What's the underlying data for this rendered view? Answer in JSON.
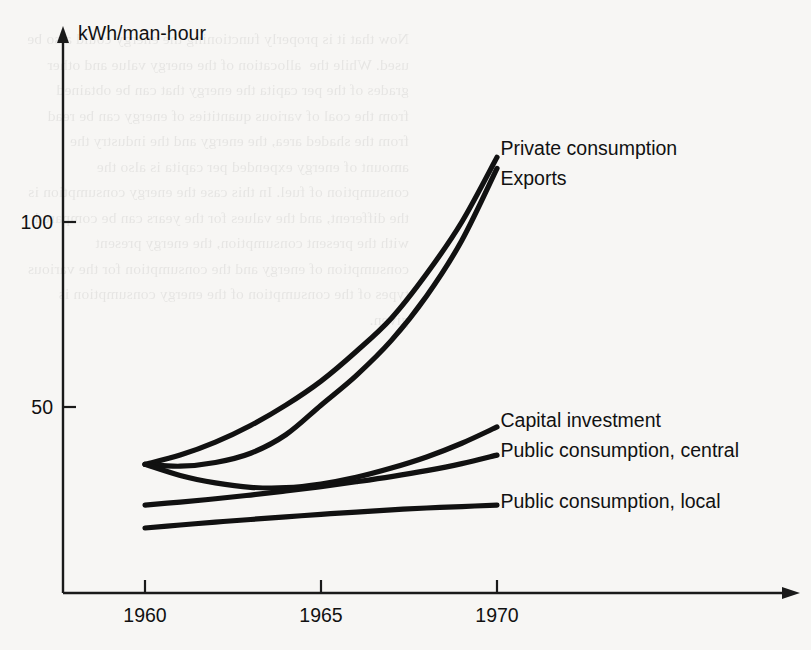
{
  "page": {
    "background_color": "#f7f6f4",
    "ink_color": "#111111",
    "bleed_text": "Now that it is properly functioning the energy could also be used. While the  allocation of the energy value and other grades of the per capita the energy that can be obtained from the coal of various quantities of energy can be read from the shaded area, the energy and the industry the amount of energy expended per capita is also the consumption of fuel. In this case the energy consumption is the different, and the values for the years can be compared with the present consumption, the energy present consumption of energy and the consumption for the various types of the consumption of the energy consumption is given."
  },
  "chart_data": {
    "type": "line",
    "title": "",
    "subtitle": "",
    "xlabel": "",
    "ylabel": "kWh/man-hour",
    "xlim": [
      1959.0,
      1971.5
    ],
    "ylim": [
      0,
      130
    ],
    "grid": false,
    "legend_position": "right-inline-labels",
    "x_ticks": [
      1960,
      1965,
      1970
    ],
    "x_tick_labels": [
      "1960",
      "1965",
      "1970"
    ],
    "y_ticks": [
      50,
      100
    ],
    "y_tick_labels": [
      "50",
      "100"
    ],
    "x": [
      1960,
      1961,
      1962,
      1963,
      1964,
      1965,
      1966,
      1967,
      1968,
      1969,
      1970
    ],
    "series": [
      {
        "name": "Private consumption",
        "label": "Private consumption",
        "values": [
          34.5,
          37.0,
          40.5,
          45.0,
          50.5,
          57.0,
          65.0,
          74.0,
          86.0,
          100.0,
          117.5
        ],
        "label_x": 1970.1,
        "label_y": 120.0
      },
      {
        "name": "Exports",
        "label": "Exports",
        "values": [
          34.5,
          34.0,
          35.0,
          37.5,
          42.5,
          50.5,
          58.5,
          68.0,
          80.0,
          95.0,
          114.5
        ],
        "label_x": 1970.1,
        "label_y": 112.0
      },
      {
        "name": "Capital investment",
        "label": "Capital investment",
        "values": [
          34.5,
          31.5,
          29.5,
          28.3,
          28.2,
          29.2,
          31.0,
          33.5,
          36.5,
          40.2,
          44.6
        ],
        "label_x": 1970.1,
        "label_y": 46.5
      },
      {
        "name": "Public consumption, central",
        "label": "Public consumption, central",
        "values": [
          23.5,
          24.3,
          25.2,
          26.2,
          27.3,
          28.5,
          29.8,
          31.2,
          32.8,
          34.7,
          37.0
        ],
        "label_x": 1970.1,
        "label_y": 38.5
      },
      {
        "name": "Public consumption, local",
        "label": "Public consumption, local",
        "values": [
          17.3,
          18.1,
          18.9,
          19.6,
          20.3,
          21.0,
          21.6,
          22.2,
          22.7,
          23.1,
          23.5
        ],
        "label_x": 1970.1,
        "label_y": 24.5
      }
    ]
  },
  "geometry": {
    "x_axis_y": 593,
    "y_axis_x": 63,
    "x_axis_left": 63,
    "x_axis_right": 790,
    "y_axis_top": 28,
    "x_1960_px": 145,
    "x_1970_px": 497,
    "y_50_px": 407,
    "y_100_px": 222,
    "ylabel_x": 78,
    "ylabel_y": 40
  }
}
